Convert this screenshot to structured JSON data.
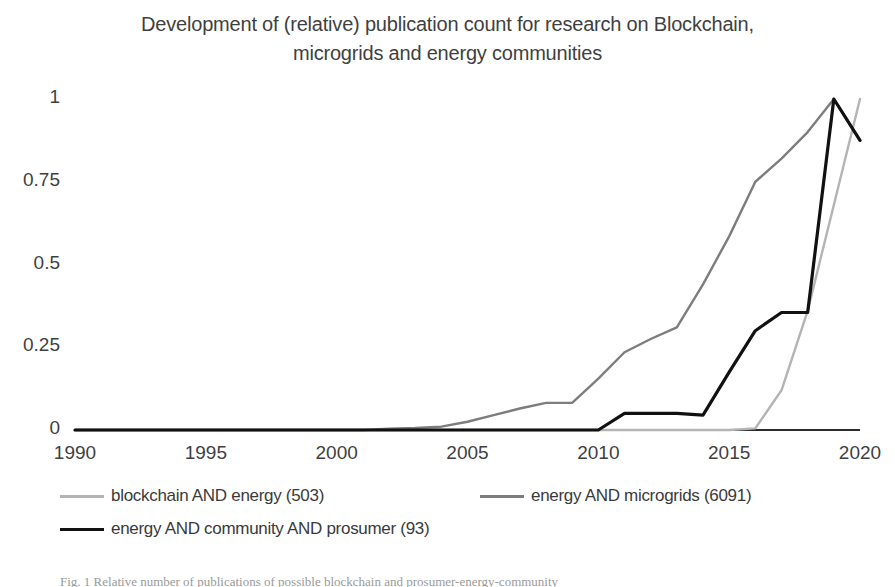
{
  "chart_data": {
    "type": "line",
    "title": "Development of (relative) publication count for research on Blockchain, microgrids and energy communities",
    "title_line1": "Development of (relative) publication count for research on Blockchain,",
    "title_line2": "microgrids and energy communities",
    "xlabel": "",
    "ylabel": "",
    "xlim": [
      1990,
      2020
    ],
    "ylim": [
      0,
      1
    ],
    "grid": false,
    "legend_position": "bottom",
    "x_ticks": [
      "1990",
      "1995",
      "2000",
      "2005",
      "2010",
      "2015",
      "2020"
    ],
    "x_tick_values": [
      1990,
      1995,
      2000,
      2005,
      2010,
      2015,
      2020
    ],
    "y_ticks": [
      "0",
      "0.25",
      "0.5",
      "0.75",
      "1"
    ],
    "y_tick_values": [
      0,
      0.25,
      0.5,
      0.75,
      1
    ],
    "x": [
      1990,
      1991,
      1992,
      1993,
      1994,
      1995,
      1996,
      1997,
      1998,
      1999,
      2000,
      2001,
      2002,
      2003,
      2004,
      2005,
      2006,
      2007,
      2008,
      2009,
      2010,
      2011,
      2012,
      2013,
      2014,
      2015,
      2016,
      2017,
      2018,
      2019,
      2020
    ],
    "series": [
      {
        "name": "blockchain AND energy (503)",
        "color": "#b4b4b4",
        "width": 2.4,
        "values": [
          0,
          0,
          0,
          0,
          0,
          0,
          0,
          0,
          0,
          0,
          0,
          0,
          0,
          0,
          0,
          0,
          0,
          0,
          0,
          0,
          0,
          0,
          0,
          0,
          0,
          0,
          0.005,
          0.12,
          0.36,
          0.68,
          1.0
        ]
      },
      {
        "name": "energy AND microgrids (6091)",
        "color": "#7d7d7d",
        "width": 2.4,
        "values": [
          0,
          0,
          0,
          0,
          0,
          0,
          0,
          0,
          0,
          0,
          0,
          0,
          0.004,
          0.006,
          0.01,
          0.025,
          0.045,
          0.065,
          0.082,
          0.082,
          0.155,
          0.235,
          0.275,
          0.31,
          0.44,
          0.585,
          0.75,
          0.82,
          0.9,
          1.0,
          0.875
        ]
      },
      {
        "name": "energy AND community AND prosumer (93)",
        "color": "#111111",
        "width": 3.2,
        "values": [
          0,
          0,
          0,
          0,
          0,
          0,
          0,
          0,
          0,
          0,
          0,
          0,
          0,
          0,
          0,
          0,
          0,
          0,
          0,
          0,
          0,
          0.05,
          0.05,
          0.05,
          0.045,
          0.175,
          0.3,
          0.355,
          0.355,
          1.0,
          0.875
        ]
      }
    ]
  },
  "legend": {
    "items": [
      {
        "label": "blockchain AND energy (503)",
        "color": "#b4b4b4"
      },
      {
        "label": "energy AND microgrids (6091)",
        "color": "#7d7d7d"
      },
      {
        "label": "energy AND community AND prosumer (93)",
        "color": "#111111"
      }
    ]
  },
  "caption": {
    "text": "Fig. 1 Relative number of publications of possible blockchain and prosumer-energy-community"
  }
}
